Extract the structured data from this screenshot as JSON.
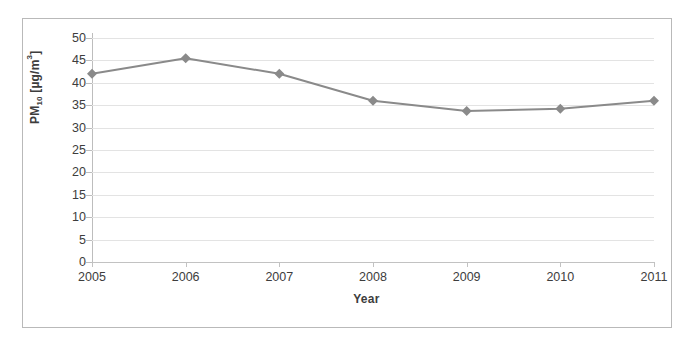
{
  "chart_data": {
    "type": "line",
    "title": "",
    "subtitle": "",
    "xlabel": "Year",
    "ylabel": "PM10 [µg/m3]",
    "ylabel_parts": {
      "base": "PM",
      "subscript": "10",
      "unit_prefix": " [µg/m",
      "unit_sup": "3",
      "unit_suffix": "]"
    },
    "categories": [
      "2005",
      "2006",
      "2007",
      "2008",
      "2009",
      "2010",
      "2011"
    ],
    "x": [
      2005,
      2006,
      2007,
      2008,
      2009,
      2010,
      2011
    ],
    "values": [
      42.0,
      45.5,
      42.0,
      36.0,
      33.7,
      34.2,
      36.0
    ],
    "series": [
      {
        "name": "PM10",
        "values": [
          42.0,
          45.5,
          42.0,
          36.0,
          33.7,
          34.2,
          36.0
        ],
        "color": "#8a8a8a",
        "marker": "diamond",
        "line_width": 2
      }
    ],
    "ylim": [
      0,
      50
    ],
    "xlim": [
      2005,
      2011
    ],
    "ytick_labels": [
      "0",
      "5",
      "10",
      "15",
      "20",
      "25",
      "30",
      "35",
      "40",
      "45",
      "50"
    ],
    "yticks": [
      0,
      5,
      10,
      15,
      20,
      25,
      30,
      35,
      40,
      45,
      50
    ],
    "ytick_step": 5,
    "grid": true,
    "grid_axis": "y",
    "grid_color": "#e3e3e3",
    "legend": false,
    "legend_position": "none",
    "annotations": [],
    "axis_color": "#bdbdbd",
    "text_color": "#3d3d3d",
    "background": "#ffffff",
    "border_color": "#b9b9b9"
  }
}
